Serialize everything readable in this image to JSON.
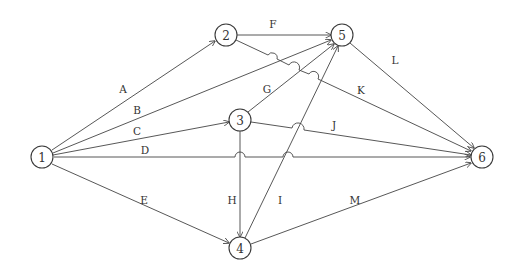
{
  "diagram": {
    "type": "activity-on-arrow network",
    "colors": {
      "line": "#444444",
      "text": "#333333",
      "background": "#ffffff"
    },
    "nodes": [
      {
        "id": "1",
        "label": "1",
        "x": 42,
        "y": 157
      },
      {
        "id": "2",
        "label": "2",
        "x": 226,
        "y": 35
      },
      {
        "id": "3",
        "label": "3",
        "x": 240,
        "y": 120
      },
      {
        "id": "4",
        "label": "4",
        "x": 240,
        "y": 248
      },
      {
        "id": "5",
        "label": "5",
        "x": 342,
        "y": 35
      },
      {
        "id": "6",
        "label": "6",
        "x": 482,
        "y": 157
      }
    ],
    "edges": [
      {
        "label": "A",
        "from": "1",
        "to": "2",
        "label_x": 123,
        "label_y": 93
      },
      {
        "label": "B",
        "from": "1",
        "to": "5",
        "label_x": 137,
        "label_y": 114
      },
      {
        "label": "C",
        "from": "1",
        "to": "3",
        "label_x": 137,
        "label_y": 135
      },
      {
        "label": "D",
        "from": "1",
        "to": "6",
        "label_x": 145,
        "label_y": 154
      },
      {
        "label": "E",
        "from": "1",
        "to": "4",
        "label_x": 144,
        "label_y": 204
      },
      {
        "label": "F",
        "from": "2",
        "to": "5",
        "label_x": 273,
        "label_y": 28
      },
      {
        "label": "G",
        "from": "3",
        "to": "5",
        "label_x": 267,
        "label_y": 93
      },
      {
        "label": "H",
        "from": "3",
        "to": "4",
        "label_x": 232,
        "label_y": 204
      },
      {
        "label": "I",
        "from": "4",
        "to": "5",
        "label_x": 280,
        "label_y": 204
      },
      {
        "label": "J",
        "from": "3",
        "to": "6",
        "label_x": 334,
        "label_y": 129
      },
      {
        "label": "K",
        "from": "2",
        "to": "6",
        "label_x": 361,
        "label_y": 94
      },
      {
        "label": "L",
        "from": "5",
        "to": "6",
        "label_x": 395,
        "label_y": 64
      },
      {
        "label": "M",
        "from": "4",
        "to": "6",
        "label_x": 355,
        "label_y": 204
      }
    ]
  }
}
